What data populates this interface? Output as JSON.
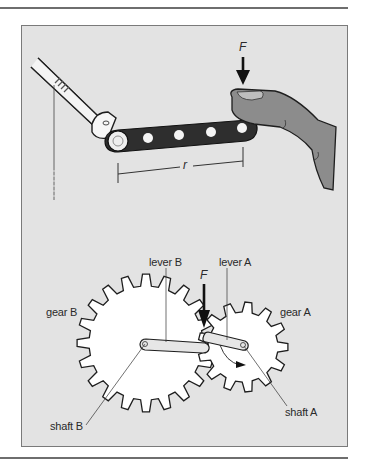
{
  "figure": {
    "top_panel": {
      "force_label": "F",
      "radius_label": "r",
      "elements": [
        "torque-bar",
        "shaft",
        "hand",
        "force-arrow",
        "radius-dimension"
      ]
    },
    "bottom_panel": {
      "force_label": "F",
      "labels": {
        "lever_b": "lever B",
        "lever_a": "lever A",
        "gear_b": "gear B",
        "gear_a": "gear A",
        "shaft_a": "shaft A",
        "shaft_b": "shaft B"
      }
    },
    "colors": {
      "frame_bg": "#e3e3e3",
      "frame_border": "#7a7a7a",
      "bar_dark": "#2e2e2e",
      "hand": "#8c8c8c",
      "gear_fill": "#ffffff",
      "ink": "#1e1e1e"
    }
  }
}
